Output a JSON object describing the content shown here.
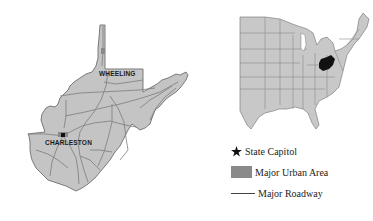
{
  "colors": {
    "state_fill": "#c4c4c4",
    "state_border": "#7a7a7a",
    "road": "#6e6e6e",
    "highlight_state": "#111111",
    "urban_area": "#8a8a8a",
    "capitol": "#111111",
    "background": "#ffffff"
  },
  "state_map": {
    "state": "West Virginia",
    "cities": [
      {
        "name": "WHEELING",
        "type": "major-city",
        "label_x": 99,
        "label_y": 70
      },
      {
        "name": "CHARLESTON",
        "type": "state-capitol",
        "label_x": 45,
        "label_y": 139
      }
    ]
  },
  "locator_map": {
    "region": "Eastern United States",
    "highlighted_state": "West Virginia"
  },
  "legend": {
    "items": [
      {
        "symbol": "star-icon",
        "label": "State Capitol"
      },
      {
        "symbol": "urban-area-swatch",
        "label": "Major Urban Area"
      },
      {
        "symbol": "roadway-line",
        "label": "Major Roadway"
      }
    ]
  }
}
